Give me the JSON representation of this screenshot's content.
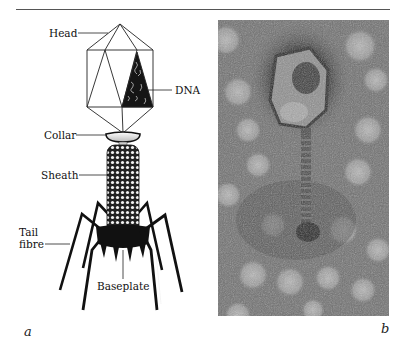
{
  "figure": {
    "panel_a": {
      "letter": "a",
      "labels": {
        "head": "Head",
        "dna": "DNA",
        "collar": "Collar",
        "sheath": "Sheath",
        "tail_fibre_line1": "Tail",
        "tail_fibre_line2": "fibre",
        "baseplate": "Baseplate"
      }
    },
    "panel_b": {
      "letter": "b",
      "description": "Electron micrograph of bacteriophage"
    }
  }
}
